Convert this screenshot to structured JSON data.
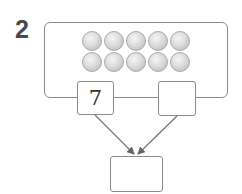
{
  "problem": {
    "number": "2",
    "ten_frame": {
      "rows": 2,
      "columns": 5,
      "total_balls": 10
    },
    "boxes": {
      "left": {
        "value": "7"
      },
      "right": {
        "value": ""
      },
      "bottom": {
        "value": ""
      }
    }
  },
  "colors": {
    "border": "#8a8a8a",
    "ball_light": "#f5f5f5",
    "ball_dark": "#b5b5b5",
    "number": "#4a4a4a"
  }
}
